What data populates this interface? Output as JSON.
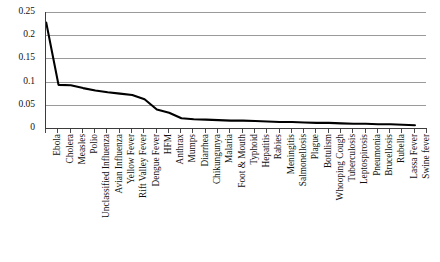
{
  "chart_data": {
    "type": "line",
    "title": "",
    "xlabel": "",
    "ylabel": "",
    "ylim": [
      0,
      0.25
    ],
    "grid": true,
    "legend": "none",
    "y_ticks": [
      "0",
      "0.05",
      "0.1",
      "0.15",
      "0.2",
      "0.25"
    ],
    "y_tick_values": [
      0,
      0.05,
      0.1,
      0.15,
      0.2,
      0.25
    ],
    "categories": [
      "Ebola",
      "Cholera",
      "Measles",
      "Polio",
      "Unclassified Influenza",
      "Avian Influenza",
      "Yellow Fever",
      "Rift Valley Fever",
      "Dengue Fever",
      "HFM",
      "Anthrax",
      "Mumps",
      "Diarrhea",
      "Chikungunya",
      "Malaria",
      "Foot & Mouth",
      "Typhoid",
      "Hepatitis",
      "Rabies",
      "Meningitis",
      "Salmonellosis",
      "Plague",
      "Botulism",
      "Whooping Cough",
      "Tuberculosis",
      "Leptospirosis",
      "Pneumonia",
      "Brucellosis",
      "Rubella",
      "Lassa Fever",
      "Swine fever"
    ],
    "values": [
      0.227,
      0.093,
      0.092,
      0.086,
      0.081,
      0.077,
      0.074,
      0.071,
      0.062,
      0.04,
      0.033,
      0.021,
      0.019,
      0.018,
      0.017,
      0.016,
      0.016,
      0.015,
      0.014,
      0.013,
      0.013,
      0.012,
      0.011,
      0.011,
      0.01,
      0.009,
      0.009,
      0.008,
      0.008,
      0.007,
      0.006
    ]
  },
  "style": {
    "line_color": "#000000",
    "grid_color": "#9a9a9a",
    "axis_color": "#3c3c3c",
    "background": "#ffffff"
  }
}
